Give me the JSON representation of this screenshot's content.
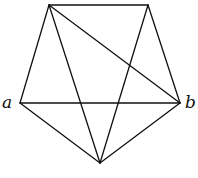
{
  "diagram": {
    "type": "graph",
    "vertices": [
      {
        "id": "top_left",
        "x": 49,
        "y": 5,
        "label": ""
      },
      {
        "id": "top_right",
        "x": 148,
        "y": 5,
        "label": ""
      },
      {
        "id": "a",
        "x": 20,
        "y": 103,
        "label": "a"
      },
      {
        "id": "b",
        "x": 180,
        "y": 103,
        "label": "b"
      },
      {
        "id": "bottom",
        "x": 100,
        "y": 163,
        "label": ""
      }
    ],
    "edges": [
      [
        "top_left",
        "top_right"
      ],
      [
        "top_left",
        "a"
      ],
      [
        "top_right",
        "b"
      ],
      [
        "a",
        "b"
      ],
      [
        "a",
        "bottom"
      ],
      [
        "b",
        "bottom"
      ],
      [
        "top_left",
        "bottom"
      ],
      [
        "top_right",
        "bottom"
      ],
      [
        "top_left",
        "b"
      ]
    ],
    "labels": {
      "a": "a",
      "b": "b"
    },
    "stroke_color": "#111111"
  }
}
